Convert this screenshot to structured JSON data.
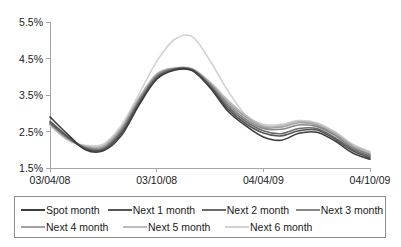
{
  "chart_data": {
    "type": "line",
    "title": "",
    "subtitle": "",
    "xlabel": "",
    "ylabel": "",
    "grid": false,
    "legend_position": "bottom",
    "x_tick_labels": [
      "03/04/08",
      "03/10/08",
      "04/04/09",
      "04/10/09"
    ],
    "x_tick_indices": [
      0,
      6,
      12,
      18
    ],
    "y_tick_labels": [
      "1.5%",
      "2.5%",
      "3.5%",
      "4.5%",
      "5.5%"
    ],
    "y_tick_values": [
      1.5,
      2.5,
      3.5,
      4.5,
      5.5
    ],
    "ylim": [
      1.5,
      5.5
    ],
    "xlim": [
      0,
      18
    ],
    "x": [
      "03/04/08",
      "03/05/08",
      "03/06/08",
      "03/07/08",
      "03/08/08",
      "03/09/08",
      "03/10/08",
      "03/11/08",
      "03/12/08",
      "04/01/09",
      "04/02/09",
      "04/03/09",
      "04/04/09",
      "04/05/09",
      "04/06/09",
      "04/07/09",
      "04/08/09",
      "04/09/09",
      "04/10/09"
    ],
    "series": [
      {
        "name": "Spot month",
        "color": "#3d3d3d",
        "values": [
          2.9,
          2.42,
          2.0,
          1.97,
          2.38,
          3.22,
          3.93,
          4.18,
          4.17,
          3.7,
          3.06,
          2.66,
          2.35,
          2.26,
          2.45,
          2.48,
          2.25,
          1.92,
          1.74
        ]
      },
      {
        "name": "Next 1 month",
        "color": "#555555",
        "values": [
          2.78,
          2.36,
          2.02,
          2.0,
          2.44,
          3.26,
          3.96,
          4.2,
          4.18,
          3.73,
          3.12,
          2.72,
          2.46,
          2.38,
          2.52,
          2.54,
          2.3,
          1.98,
          1.78
        ]
      },
      {
        "name": "Next 2 month",
        "color": "#6b6b6b",
        "values": [
          2.74,
          2.34,
          2.04,
          2.02,
          2.48,
          3.3,
          3.99,
          4.21,
          4.19,
          3.76,
          3.18,
          2.78,
          2.52,
          2.44,
          2.58,
          2.58,
          2.34,
          2.02,
          1.82
        ]
      },
      {
        "name": "Next 3 month",
        "color": "#878787",
        "values": [
          2.72,
          2.32,
          2.06,
          2.05,
          2.52,
          3.34,
          4.02,
          4.22,
          4.2,
          3.79,
          3.24,
          2.84,
          2.58,
          2.56,
          2.68,
          2.64,
          2.4,
          2.06,
          1.86
        ]
      },
      {
        "name": "Next 4 month",
        "color": "#a0a0a0",
        "values": [
          2.7,
          2.3,
          2.08,
          2.08,
          2.56,
          3.38,
          4.05,
          4.23,
          4.21,
          3.82,
          3.3,
          2.9,
          2.62,
          2.62,
          2.74,
          2.68,
          2.44,
          2.1,
          1.88
        ]
      },
      {
        "name": "Next 5 month",
        "color": "#bcbcbc",
        "values": [
          2.68,
          2.28,
          2.1,
          2.12,
          2.6,
          3.42,
          4.08,
          4.24,
          4.22,
          3.86,
          3.36,
          2.94,
          2.66,
          2.66,
          2.78,
          2.72,
          2.48,
          2.14,
          1.92
        ]
      },
      {
        "name": "Next 6 month",
        "color": "#d2d2d2",
        "values": [
          2.66,
          2.26,
          2.12,
          2.16,
          2.66,
          3.52,
          4.42,
          5.02,
          5.1,
          4.44,
          3.62,
          2.96,
          2.7,
          2.7,
          2.8,
          2.74,
          2.5,
          2.16,
          1.95
        ]
      }
    ]
  },
  "legend": {
    "rows": [
      [
        {
          "label": "Spot month",
          "color": "#3d3d3d",
          "width_class": "lw-1"
        },
        {
          "label": "Next 1 month",
          "color": "#555555",
          "width_class": "lw-1"
        },
        {
          "label": "Next 2 month",
          "color": "#6b6b6b",
          "width_class": "lw-1"
        },
        {
          "label": "Next 3 month",
          "color": "#878787",
          "width_class": "lw-1"
        }
      ],
      [
        {
          "label": "Next 4 month",
          "color": "#a0a0a0",
          "width_class": "lw-2"
        },
        {
          "label": "Next 5 month",
          "color": "#bcbcbc",
          "width_class": "lw-2"
        },
        {
          "label": "Next 6 month",
          "color": "#d2d2d2",
          "width_class": "lw-2"
        }
      ]
    ]
  },
  "axis_colors": {
    "axis_line": "#a6a6a6",
    "tick_text": "#1a1a1a",
    "legend_border": "#8c8c8c"
  }
}
